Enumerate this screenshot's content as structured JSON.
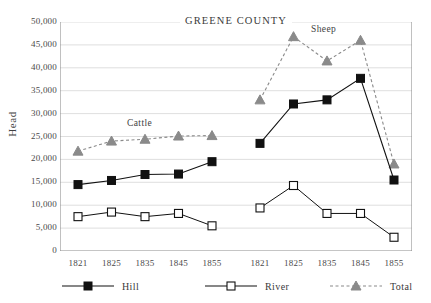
{
  "chart_data": {
    "type": "line",
    "title": "GREENE COUNTY",
    "xlabel": "",
    "ylabel": "Head",
    "ylim": [
      0,
      50000
    ],
    "ytick_labels": [
      "50,000",
      "45,000",
      "40,000",
      "35,000",
      "30,000",
      "25,000",
      "20,000",
      "15,000",
      "10,000",
      "5,000",
      "0"
    ],
    "ytick_values": [
      50000,
      45000,
      40000,
      35000,
      30000,
      25000,
      20000,
      15000,
      10000,
      5000,
      0
    ],
    "grid": true,
    "legend_position": "bottom",
    "panels": [
      {
        "name": "Cattle",
        "annotation": "Cattle",
        "categories": [
          "1821",
          "1825",
          "1835",
          "1845",
          "1855"
        ],
        "series": [
          {
            "name": "Hill",
            "values": [
              14500,
              15400,
              16700,
              16800,
              19500
            ]
          },
          {
            "name": "River",
            "values": [
              7500,
              8500,
              7500,
              8200,
              5500
            ]
          },
          {
            "name": "Total",
            "values": [
              21800,
              24000,
              24400,
              25100,
              25200
            ]
          }
        ]
      },
      {
        "name": "Sheep",
        "annotation": "Sheep",
        "categories": [
          "1821",
          "1825",
          "1835",
          "1845",
          "1855"
        ],
        "series": [
          {
            "name": "Hill",
            "values": [
              23500,
              32100,
              33000,
              37700,
              15500
            ]
          },
          {
            "name": "River",
            "values": [
              9400,
              14300,
              8200,
              8200,
              3000
            ]
          },
          {
            "name": "Total",
            "values": [
              33000,
              46800,
              41500,
              46000,
              19000
            ]
          }
        ]
      }
    ],
    "legend": [
      {
        "label": "Hill",
        "marker": "filled-square",
        "line": "solid",
        "color": "#111111"
      },
      {
        "label": "River",
        "marker": "open-square",
        "line": "solid",
        "color": "#111111"
      },
      {
        "label": "Total",
        "marker": "filled-triangle",
        "line": "dashed",
        "color": "#8a8a8a"
      }
    ],
    "colors": {
      "grid": "#d6d6d6",
      "axis": "#8c8c8c",
      "hill": "#111111",
      "river": "#111111",
      "total": "#8a8a8a",
      "text": "#3a3a3a"
    }
  }
}
